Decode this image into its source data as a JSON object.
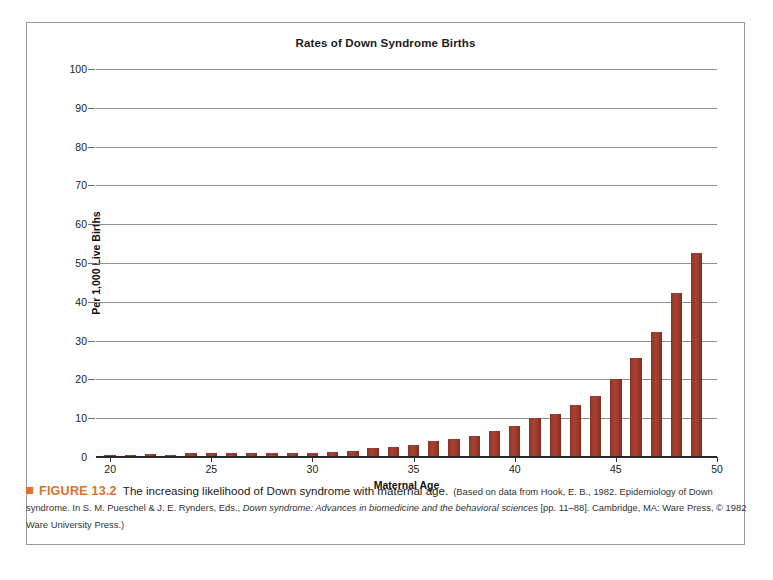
{
  "figure": {
    "chart_title": "Rates of Down Syndrome Births",
    "caption": {
      "bullet_icon": "orange-square-bullet",
      "figure_number": "FIGURE 13.2",
      "lead": "The increasing likelihood of Down syndrome with maternal age.",
      "source_part1": "(Based on data from Hook, E. B., 1982. Epidemiology of Down syndrome. In S. M. Pueschel & J. E. Rynders, Eds., ",
      "source_italic": "Down syndrome: Advances in biomedicine and the behavioral sciences",
      "source_part2": " [pp. 11–88]. Cambridge, MA: Ware Press, © 1982 Ware University Press.)"
    }
  },
  "chart_data": {
    "type": "bar",
    "title": "Rates of Down Syndrome Births",
    "xlabel": "Maternal Age",
    "ylabel": "Per 1,000 Live Births",
    "xlim": [
      19.3,
      50
    ],
    "ylim": [
      0,
      100
    ],
    "xticks": [
      20,
      25,
      30,
      35,
      40,
      45,
      50
    ],
    "yticks": [
      0,
      10,
      20,
      30,
      40,
      50,
      60,
      70,
      80,
      90,
      100
    ],
    "grid": true,
    "legend": null,
    "bar_color": "#9b3a2b",
    "categories": [
      20,
      21,
      22,
      23,
      24,
      25,
      26,
      27,
      28,
      29,
      30,
      31,
      32,
      33,
      34,
      35,
      36,
      37,
      38,
      39,
      40,
      41,
      42,
      43,
      44,
      45,
      46,
      47,
      48,
      49
    ],
    "values": [
      0.6,
      0.6,
      0.7,
      0.6,
      0.9,
      0.9,
      1.0,
      0.9,
      0.9,
      1.0,
      1.0,
      1.1,
      1.4,
      1.9,
      2.3,
      2.6,
      3.3,
      4.0,
      4.7,
      5.5,
      6.8,
      8.1,
      10.1,
      12.0,
      15.5,
      20.0,
      25.5,
      32.2,
      42.1,
      52.6
    ],
    "extra_values_note": null
  },
  "chart_bars": [
    {
      "age": 20,
      "rate": 0.6
    },
    {
      "age": 21,
      "rate": 0.6
    },
    {
      "age": 22,
      "rate": 0.7
    },
    {
      "age": 23,
      "rate": 0.6
    },
    {
      "age": 24,
      "rate": 1.0
    },
    {
      "age": 25,
      "rate": 1.0
    },
    {
      "age": 26,
      "rate": 1.1
    },
    {
      "age": 27,
      "rate": 1.0
    },
    {
      "age": 28,
      "rate": 1.0
    },
    {
      "age": 29,
      "rate": 1.1
    },
    {
      "age": 30,
      "rate": 1.1
    },
    {
      "age": 31,
      "rate": 1.2
    },
    {
      "age": 32,
      "rate": 1.6
    },
    {
      "age": 33,
      "rate": 2.2
    },
    {
      "age": 34,
      "rate": 2.6
    },
    {
      "age": 35,
      "rate": 3.1
    },
    {
      "age": 36,
      "rate": 4.0
    },
    {
      "age": 37,
      "rate": 4.7
    },
    {
      "age": 38,
      "rate": 5.5
    },
    {
      "age": 39,
      "rate": 6.6
    },
    {
      "age": 40,
      "rate": 8.1
    },
    {
      "age": 41,
      "rate": 10.1
    },
    {
      "age": 42,
      "rate": 11.2
    },
    {
      "age": 43,
      "rate": 13.5
    },
    {
      "age": 44,
      "rate": 15.8
    },
    {
      "age": 45,
      "rate": 20.2
    },
    {
      "age": 46,
      "rate": 25.6
    },
    {
      "age": 47,
      "rate": 32.3
    },
    {
      "age": 48,
      "rate": 42.2
    },
    {
      "age": 49,
      "rate": 52.7
    }
  ]
}
